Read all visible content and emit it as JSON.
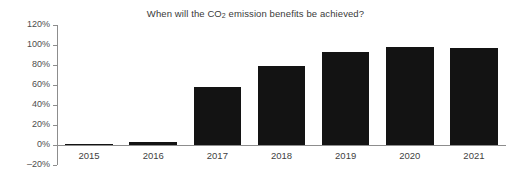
{
  "chart_data": {
    "type": "bar",
    "title": "When will the CO2 emission benefits be achieved?",
    "title_parts": {
      "before": "When will the CO",
      "sub": "2",
      "after": " emission benefits be achieved?"
    },
    "xlabel": "",
    "ylabel": "",
    "categories": [
      "2015",
      "2016",
      "2017",
      "2018",
      "2019",
      "2020",
      "2021"
    ],
    "values": [
      0,
      3,
      58,
      79,
      93,
      98,
      97
    ],
    "value_labels": [
      "0%",
      "3%",
      "58%",
      "79%",
      "93%",
      "98%",
      "97%"
    ],
    "ylim": [
      -20,
      120
    ],
    "ytick_values": [
      120,
      100,
      80,
      60,
      40,
      20,
      0,
      -20
    ],
    "ytick_labels": [
      "120%",
      "100%",
      "80%",
      "60%",
      "40%",
      "20%",
      "0%",
      "–20%"
    ],
    "grid": false,
    "legend": null,
    "legend_position": "none",
    "series": [
      {
        "name": "CO2 emission benefits achieved",
        "values": [
          0,
          3,
          58,
          79,
          93,
          98,
          97
        ]
      }
    ],
    "colors": {
      "bar": "#131313",
      "axis": "#8d8d8d",
      "text": "#3f3f3f",
      "title": "#3a3a3a",
      "background": "#ffffff"
    }
  }
}
